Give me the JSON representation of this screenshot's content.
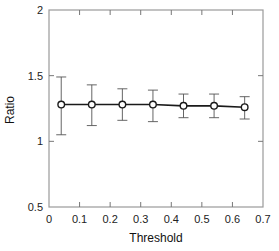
{
  "chart_data": {
    "type": "line",
    "title": "",
    "xlabel": "Threshold",
    "ylabel": "Ratio",
    "xlim": [
      0,
      0.7
    ],
    "ylim": [
      0.5,
      2
    ],
    "x_ticks": [
      0,
      0.1,
      0.2,
      0.3,
      0.4,
      0.5,
      0.6,
      0.7
    ],
    "x_tick_labels": [
      "0",
      "0.1",
      "0.2",
      "0.3",
      "0.4",
      "0.5",
      "0.6",
      "0.7"
    ],
    "y_ticks": [
      0.5,
      1,
      1.5,
      2
    ],
    "y_tick_labels": [
      "0.5",
      "1",
      "1.5",
      "2"
    ],
    "grid": false,
    "legend": null,
    "series": [
      {
        "name": "Ratio",
        "marker": "open-circle",
        "line_color": "#1a1a1a",
        "errorbar_color": "#555555",
        "x": [
          0.04,
          0.14,
          0.24,
          0.34,
          0.44,
          0.54,
          0.64
        ],
        "y": [
          1.28,
          1.28,
          1.28,
          1.28,
          1.27,
          1.27,
          1.26
        ],
        "y_upper": [
          1.49,
          1.43,
          1.4,
          1.39,
          1.36,
          1.36,
          1.34
        ],
        "y_lower": [
          1.05,
          1.12,
          1.16,
          1.15,
          1.18,
          1.18,
          1.17
        ]
      }
    ]
  }
}
